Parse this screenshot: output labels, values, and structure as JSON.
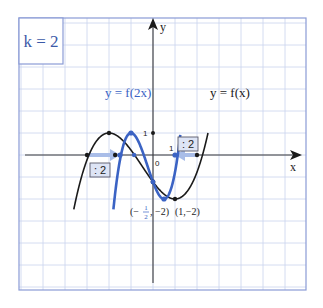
{
  "k_box": {
    "label": "k = 2"
  },
  "axes": {
    "x_label": "x",
    "y_label": "y",
    "origin_label": "0",
    "x_tick_label": "1",
    "y_tick_label": "1"
  },
  "curves": {
    "f": {
      "label": "y = f(x)",
      "color": "#1a1a1a"
    },
    "g": {
      "label": "y = f(2x)",
      "color": "#3b63c4"
    }
  },
  "scale_badges": [
    {
      "label": ": 2"
    },
    {
      "label": ": 2"
    }
  ],
  "point_labels": {
    "g_min": {
      "prefix": "(−",
      "num": "1",
      "den": "2",
      "suffix": ", −2)"
    },
    "f_min": "(1,−2)"
  },
  "colors": {
    "grid": "#c9d3ee",
    "frame": "#8a9bd6",
    "axis": "#3a3a3a",
    "arrow_light": "#a9bde8",
    "badge_bg": "#dde4f5",
    "badge_border": "#5a5a6a"
  },
  "chart_data": {
    "type": "line",
    "xlabel": "x",
    "ylabel": "y",
    "xlim": [
      -6,
      6.5
    ],
    "ylim": [
      -6,
      6
    ],
    "grid": true,
    "unit_px": 22,
    "series": [
      {
        "name": "y = f(x)",
        "formula": "f(x) = (2/9)(x^3 + 1.5x^2 - 6x) - 11/9",
        "key_points": [
          {
            "x": -3,
            "y": 0,
            "label": "root"
          },
          {
            "x": -2,
            "y": 1,
            "label": "local max"
          },
          {
            "x": 1,
            "y": -2,
            "label": "local min (1,-2)"
          },
          {
            "x": 2,
            "y": 0,
            "label": "root"
          }
        ]
      },
      {
        "name": "y = f(2x)",
        "formula": "g(x) = f(2x)",
        "key_points": [
          {
            "x": -1.5,
            "y": 0,
            "label": "root"
          },
          {
            "x": -1,
            "y": 1,
            "label": "local max"
          },
          {
            "x": 0.5,
            "y": -2,
            "label": "local min (-1/2,-2)"
          },
          {
            "x": 1,
            "y": 0,
            "label": "root"
          }
        ]
      }
    ],
    "annotations": [
      ": 2 (left root arrow)",
      ": 2 (right root arrow)",
      "k = 2"
    ]
  }
}
